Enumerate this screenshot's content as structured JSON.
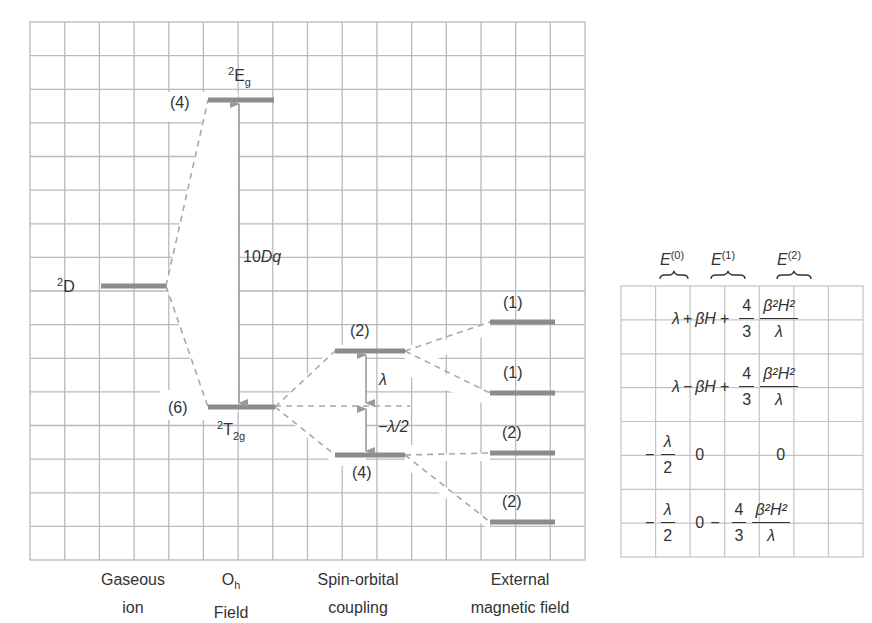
{
  "diagram": {
    "colors": {
      "grid": "#b9b9b9",
      "level": "#8c8c8c",
      "dash": "#a8a8a8",
      "arrow": "#9a9a9a",
      "text": "#333333"
    },
    "columns": [
      {
        "line1": "Gaseous",
        "line2": "ion"
      },
      {
        "line1": "O",
        "line1_sub": "h",
        "line2": "Field"
      },
      {
        "line1": "Spin-orbital",
        "line2": "coupling"
      },
      {
        "line1": "External",
        "line2": "magnetic field"
      }
    ],
    "terms": {
      "free_ion": {
        "sup": "2",
        "main": "D"
      },
      "eg": {
        "sup": "2",
        "main": "E",
        "sub": "g",
        "degeneracy": "(4)"
      },
      "t2g": {
        "sup": "2",
        "main": "T",
        "sub": "2g",
        "degeneracy": "(6)"
      }
    },
    "splittings": {
      "crystal_field": {
        "num": "10",
        "sym": "Dq"
      },
      "so_upper": "λ",
      "so_lower": "−λ/2"
    },
    "spin_orbit_levels": [
      "(2)",
      "(4)"
    ],
    "zeeman_levels": [
      "(1)",
      "(1)",
      "(2)",
      "(2)"
    ],
    "table": {
      "headers": [
        {
          "main": "E",
          "sup": "(0)"
        },
        {
          "main": "E",
          "sup": "(1)"
        },
        {
          "main": "E",
          "sup": "(2)"
        }
      ],
      "rows": [
        {
          "e0": "λ",
          "op1": "+",
          "e1": "βH",
          "op2": "+",
          "coef_num": "4",
          "coef_den": "3",
          "frac_num": "β²H²",
          "frac_den": "λ"
        },
        {
          "e0": "λ",
          "op1": "−",
          "e1": "βH",
          "op2": "+",
          "coef_num": "4",
          "coef_den": "3",
          "frac_num": "β²H²",
          "frac_den": "λ"
        },
        {
          "e0_sign": "−",
          "e0_num": "λ",
          "e0_den": "2",
          "e1": "0",
          "e2": "0"
        },
        {
          "e0_sign": "−",
          "e0_num": "λ",
          "e0_den": "2",
          "e1": "0",
          "op2": "−",
          "coef_num": "4",
          "coef_den": "3",
          "frac_num": "β²H²",
          "frac_den": "λ"
        }
      ]
    }
  }
}
